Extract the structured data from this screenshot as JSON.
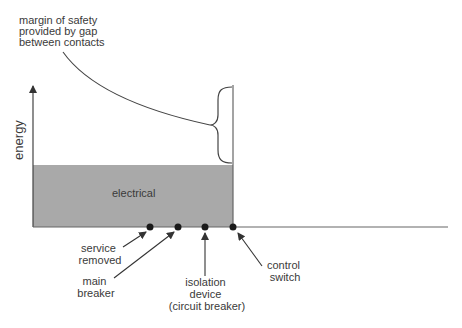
{
  "diagram": {
    "annotation": {
      "lines": [
        "margin of safety",
        "provided by gap",
        "between contacts"
      ]
    },
    "y_axis_label": "energy",
    "region_label": "electrical",
    "markers": [
      {
        "id": "service-removed",
        "lines": [
          "service",
          "removed"
        ]
      },
      {
        "id": "main-breaker",
        "lines": [
          "main",
          "breaker"
        ]
      },
      {
        "id": "isolation-device",
        "lines": [
          "isolation",
          "device",
          "(circuit breaker)"
        ]
      },
      {
        "id": "control-switch",
        "lines": [
          "control",
          "switch"
        ]
      }
    ],
    "colors": {
      "fill": "#a9a9a9",
      "line": "#555555",
      "text": "#3a3a3a",
      "dot": "#1a1a1a"
    }
  }
}
